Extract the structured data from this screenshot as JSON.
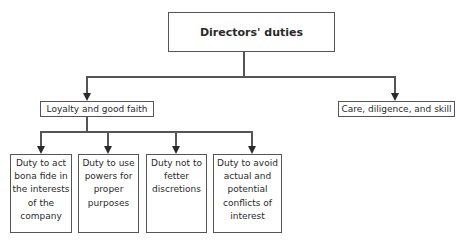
{
  "diagram": {
    "type": "hierarchy",
    "root": {
      "label": "Directors' duties"
    },
    "level1": [
      {
        "label": "Loyalty and good faith"
      },
      {
        "label": "Care, diligence, and skill"
      }
    ],
    "level2_under_loyalty": [
      {
        "label": "Duty to act\nbona fide in\nthe interests\nof the\ncompany"
      },
      {
        "label": "Duty to use\npowers for\nproper\npurposes"
      },
      {
        "label": "Duty not to\nfetter\ndiscretions"
      },
      {
        "label": "Duty to avoid\nactual and\npotential\nconflicts of\ninterest"
      }
    ],
    "colors": {
      "line": "#555555",
      "arrow": "#2a2a2a",
      "text": "#2a2a2a",
      "background": "#ffffff"
    }
  }
}
